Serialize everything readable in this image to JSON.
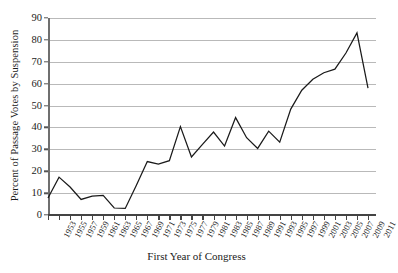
{
  "chart_data": {
    "type": "line",
    "title": "",
    "xlabel": "First Year of Congress",
    "ylabel": "Percent of Passage Votes by Suspension",
    "xlim": [
      1953,
      2011
    ],
    "ylim": [
      0,
      90
    ],
    "ytick_step": 10,
    "grid": true,
    "legend": null,
    "line_color": "#1a1a1a",
    "grid_color": "#b9b9b9",
    "categories": [
      "1953",
      "1955",
      "1957",
      "1959",
      "1961",
      "1963",
      "1965",
      "1967",
      "1969",
      "1971",
      "1973",
      "1975",
      "1977",
      "1979",
      "1981",
      "1983",
      "1985",
      "1987",
      "1989",
      "1991",
      "1993",
      "1995",
      "1997",
      "1999",
      "2001",
      "2003",
      "2005",
      "2007",
      "2009",
      "2011"
    ],
    "x": [
      1953,
      1955,
      1957,
      1959,
      1961,
      1963,
      1965,
      1967,
      1969,
      1971,
      1973,
      1975,
      1977,
      1979,
      1981,
      1983,
      1985,
      1987,
      1989,
      1991,
      1993,
      1995,
      1997,
      1999,
      2001,
      2003,
      2005,
      2007,
      2009,
      2011
    ],
    "values": [
      7.8,
      17.3,
      12.8,
      7.1,
      8.6,
      9.0,
      3.2,
      3.0,
      13.5,
      24.4,
      23.3,
      24.8,
      40.4,
      26.5,
      32.3,
      37.9,
      31.5,
      44.5,
      35.3,
      30.4,
      38.3,
      33.3,
      48.4,
      57.0,
      62.0,
      65.0,
      66.6,
      74.0,
      83.2,
      58.0
    ],
    "ytick_labels": [
      "0",
      "10",
      "20",
      "30",
      "40",
      "50",
      "60",
      "70",
      "80",
      "90"
    ]
  },
  "axes": {
    "y_title": "Percent of Passage Votes by Suspension",
    "x_title": "First Year of Congress"
  }
}
